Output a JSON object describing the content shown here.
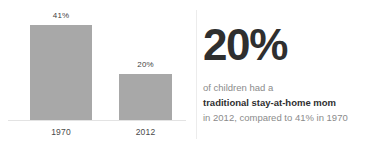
{
  "chart_data": {
    "type": "bar",
    "title": "",
    "xlabel": "",
    "ylabel": "",
    "categories": [
      "1970",
      "2012"
    ],
    "values": [
      41,
      20
    ],
    "value_labels": [
      "41%",
      "20%"
    ],
    "ylim": [
      0,
      46
    ],
    "grid": false,
    "legend": false,
    "series": [
      {
        "name": "Children with a traditional stay-at-home mom",
        "values": [
          41,
          20
        ]
      }
    ],
    "bar_color": "#a8a8a8",
    "unit": "%"
  },
  "callout": {
    "headline": "20%",
    "line1": "of children had a",
    "line2": "traditional stay-at-home mom",
    "line3": "in 2012, compared to 41% in 1970",
    "headline_color": "#2f2f2f",
    "muted_color": "#8b8b8b"
  }
}
